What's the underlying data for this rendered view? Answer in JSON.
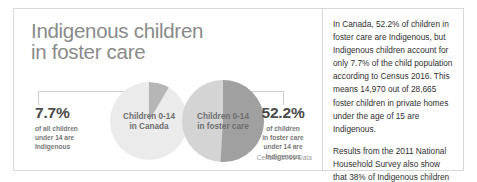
{
  "card": {
    "title": "Indigenous children\nin foster care",
    "caption": "Census 2016 Data"
  },
  "charts": {
    "canada": {
      "label": "Children 0-14\nin Canada",
      "callout_pct": "7.7%",
      "callout_sub": "of all children\nunder 14 are\nIndigenous",
      "base_color": "#ebebeb",
      "wedge_color": "#b6b6b6"
    },
    "foster": {
      "label": "Children 0-14\nin foster care",
      "callout_pct": "52.2%",
      "callout_sub": "of children\nin foster care\nunder 14 are\nIndigenous",
      "base_color": "#d4d4d4",
      "wedge_color": "#a0a0a0"
    }
  },
  "article": {
    "paragraph_1": "In Canada, 52.2% of children in foster care are Indigenous, but Indigenous children account for only 7.7% of the child population according to Census 2016. This means 14,970 out of 28,665 foster children in private homes under the age of 15 are Indigenous.",
    "paragraph_2": "Results from the 2011 National Household Survey also show that 38% of Indigenous children in Canada live in poverty, compared to 7% of non-Indigenous children."
  },
  "chart_data": {
    "type": "pie",
    "title": "Indigenous children in foster care",
    "annotation": "Census 2016 Data",
    "charts": [
      {
        "name": "Children 0-14 in Canada",
        "categories": [
          "Indigenous",
          "Non-Indigenous"
        ],
        "values": [
          7.7,
          92.3
        ],
        "unit": "%",
        "colors": [
          "#b6b6b6",
          "#ebebeb"
        ]
      },
      {
        "name": "Children 0-14 in foster care",
        "categories": [
          "Indigenous",
          "Non-Indigenous"
        ],
        "values": [
          52.2,
          47.8
        ],
        "unit": "%",
        "colors": [
          "#a0a0a0",
          "#d4d4d4"
        ]
      }
    ],
    "supporting_figures": {
      "indigenous_foster_children": 14970,
      "total_foster_children": 28665,
      "foster_age_limit_years": 15,
      "indigenous_child_poverty_pct": 38,
      "non_indigenous_child_poverty_pct": 7,
      "poverty_source": "2011 National Household Survey"
    },
    "legend": false,
    "grid": false
  }
}
